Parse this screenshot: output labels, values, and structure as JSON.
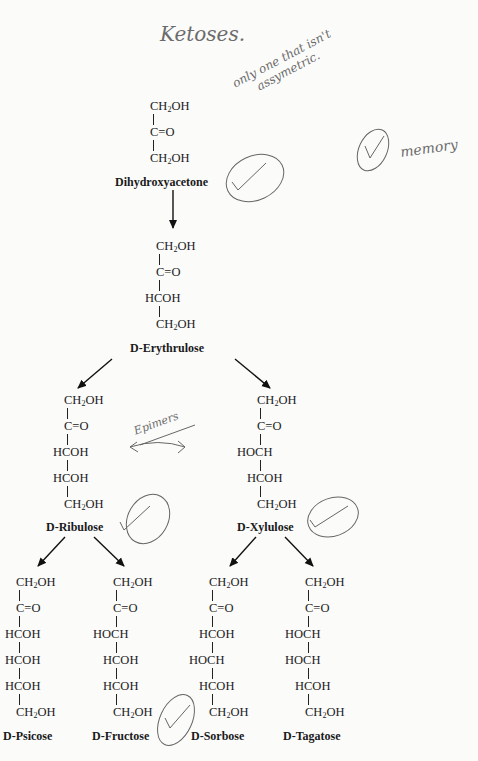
{
  "title": "Ketoses.",
  "annotations": {
    "note_line1": "only one that isn't",
    "note_line2": "assymetric.",
    "memory_note": "memory",
    "epimers": "Epimers"
  },
  "structures": {
    "dihydroxyacetone": {
      "name": "Dihydroxyacetone",
      "lines": [
        "CH2OH",
        "C=O",
        "CH2OH"
      ],
      "checked": true
    },
    "erythrulose": {
      "name_prefix": "D",
      "name": "-Erythrulose",
      "lines": [
        "CH2OH",
        "C=O",
        "HCOH",
        "CH2OH"
      ]
    },
    "ribulose": {
      "name_prefix": "D",
      "name": "-Ribulose",
      "lines": [
        "CH2OH",
        "C=O",
        "HCOH",
        "HCOH",
        "CH2OH"
      ],
      "checked": true
    },
    "xylulose": {
      "name_prefix": "D",
      "name": "-Xylulose",
      "lines": [
        "CH2OH",
        "C=O",
        "HOCH",
        "HCOH",
        "CH2OH"
      ],
      "checked": true
    },
    "psicose": {
      "name_prefix": "D",
      "name": "-Psicose",
      "lines": [
        "CH2OH",
        "C=O",
        "HCOH",
        "HCOH",
        "HCOH",
        "CH2OH"
      ]
    },
    "fructose": {
      "name_prefix": "D",
      "name": "-Fructose",
      "lines": [
        "CH2OH",
        "C=O",
        "HOCH",
        "HCOH",
        "HCOH",
        "CH2OH"
      ],
      "checked": true
    },
    "sorbose": {
      "name_prefix": "D",
      "name": "-Sorbose",
      "lines": [
        "CH2OH",
        "C=O",
        "HCOH",
        "HOCH",
        "HCOH",
        "CH2OH"
      ]
    },
    "tagatose": {
      "name_prefix": "D",
      "name": "-Tagatose",
      "lines": [
        "CH2OH",
        "C=O",
        "HOCH",
        "HOCH",
        "HCOH",
        "CH2OH"
      ]
    }
  },
  "text": {
    "ch2oh_c": "CH",
    "ch2oh_sub": "2",
    "ch2oh_end": "OH",
    "co": "C=O",
    "hcoh": "HCOH",
    "hoch": "HOCH"
  }
}
